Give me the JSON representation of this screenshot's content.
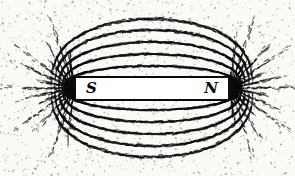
{
  "figure": {
    "background_color": "#fbfaf7",
    "filing_color": "#0d0d0d",
    "width": 295,
    "height": 176
  },
  "magnet": {
    "label_south": "S",
    "label_north": "N",
    "body_color": "#ffffff",
    "edge_color": "#0a0a0a",
    "x": 75,
    "y": 76,
    "width": 154,
    "height": 25
  },
  "poles": [
    {
      "name": "south",
      "label": "S",
      "cx": 74,
      "cy": 88
    },
    {
      "name": "north",
      "label": "N",
      "cx": 230,
      "cy": 88
    }
  ],
  "field_pattern": {
    "type": "iron-filings",
    "spoke_count_per_pole": 15,
    "arc_count_above": 5,
    "arc_count_below": 5,
    "particle_count": 17000,
    "spoke_inner_radius": 8,
    "spoke_outer_radius": 72,
    "arc_peak_heights": [
      22,
      34,
      46,
      58,
      69
    ],
    "notes": "Radial spokes emanate from each pole; concentric arcs bridge S to N above and below the bar."
  },
  "chart_data": {
    "type": "scatter",
    "xlabel": "",
    "ylabel": "",
    "xlim": [
      0,
      295
    ],
    "ylim": [
      0,
      176
    ],
    "grid": false,
    "legend": "none",
    "annotations": [
      {
        "text": "S",
        "x": 88,
        "y": 89
      },
      {
        "text": "N",
        "x": 216,
        "y": 89
      }
    ],
    "series": [
      {
        "name": "south-pole-spokes",
        "origin": [
          74,
          88
        ],
        "count": 15
      },
      {
        "name": "north-pole-spokes",
        "origin": [
          230,
          88
        ],
        "count": 15
      },
      {
        "name": "upper-field-arcs",
        "count": 5,
        "peaks": [
          22,
          34,
          46,
          58,
          69
        ]
      },
      {
        "name": "lower-field-arcs",
        "count": 5,
        "peaks": [
          22,
          34,
          46,
          58,
          69
        ]
      }
    ]
  }
}
